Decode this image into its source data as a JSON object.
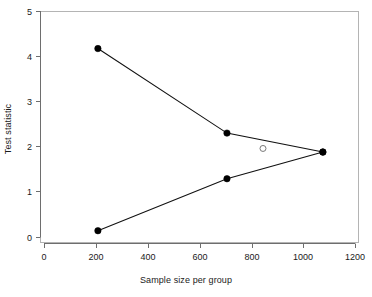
{
  "chart_data": {
    "type": "line",
    "title": "",
    "subtitle": "",
    "xlabel": "Sample size per group",
    "ylabel": "Test statistic",
    "xlim": [
      0,
      1200
    ],
    "ylim": [
      0,
      5
    ],
    "xticks": [
      0,
      200,
      400,
      600,
      800,
      1000,
      1200
    ],
    "yticks": [
      0,
      1,
      2,
      3,
      4,
      5
    ],
    "xtick_labels": [
      "0",
      "200",
      "400",
      "600",
      "800",
      "1000",
      "1200"
    ],
    "ytick_labels": [
      "0",
      "1",
      "2",
      "3",
      "4",
      "5"
    ],
    "grid": false,
    "legend": null,
    "legend_position": "none",
    "series": [
      {
        "name": "upper-boundary",
        "marker": "filled-circle",
        "color": "#000000",
        "x": [
          208,
          706,
          1076
        ],
        "values": [
          4.18,
          2.31,
          1.89
        ]
      },
      {
        "name": "lower-boundary",
        "marker": "filled-circle",
        "color": "#000000",
        "x": [
          208,
          706,
          1076
        ],
        "values": [
          0.15,
          1.3,
          1.89
        ]
      },
      {
        "name": "observed-point",
        "marker": "open-circle",
        "color": "#555555",
        "x": [
          845
        ],
        "values": [
          1.97
        ]
      }
    ],
    "annotations": []
  },
  "axes": {
    "x_title": "Sample size per group",
    "y_title": "Test statistic"
  },
  "style": {
    "box_color": "#b4b4b4",
    "axis_color": "#6e6e6e",
    "line_color": "#111111",
    "point_fill": "#000000",
    "open_point_stroke": "#7a7a7a",
    "background": "#ffffff"
  }
}
